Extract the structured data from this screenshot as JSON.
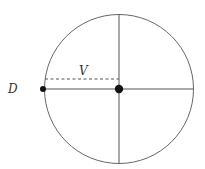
{
  "diagram": {
    "labels": {
      "left_point": "D",
      "radius_segment": "V"
    },
    "circle": {
      "cx": 119,
      "cy": 89,
      "r": 74.5,
      "stroke": "#666666"
    },
    "center_point": {
      "cx": 119,
      "cy": 89,
      "r": 4.2,
      "fill": "#111111"
    },
    "left_point": {
      "cx": 43,
      "cy": 89,
      "r": 3,
      "fill": "#111111"
    },
    "axes": {
      "horizontal": {
        "x1": 43,
        "y1": 89,
        "x2": 193,
        "y2": 89
      },
      "vertical": {
        "x1": 119,
        "y1": 14,
        "x2": 119,
        "y2": 163
      }
    },
    "dashed_segment": {
      "x1": 45,
      "y1": 79,
      "x2": 119,
      "y2": 79
    }
  }
}
